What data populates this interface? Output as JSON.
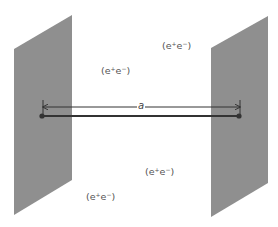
{
  "diagram": {
    "plates": [
      {
        "id": "left",
        "points": "14,49 72,15 72,180 14,215"
      },
      {
        "id": "right",
        "points": "211,48 268,16 268,183 211,217"
      }
    ],
    "colors": {
      "plate": "#8f8f8f",
      "line": "#333333",
      "text": "#555555"
    },
    "separation": {
      "label": "a",
      "arrow_y": 107,
      "x_start": 43,
      "x_end": 240
    },
    "connector": {
      "y": 116,
      "x_start": 42,
      "x_end": 239
    },
    "pair_labels": [
      {
        "text_open": "(e",
        "sup1": "+",
        "mid": "e",
        "sup2": "−",
        "text_close": ")",
        "x": 101,
        "y": 66
      },
      {
        "text_open": "(e",
        "sup1": "+",
        "mid": "e",
        "sup2": "−",
        "text_close": ")",
        "x": 162,
        "y": 41
      },
      {
        "text_open": "(e",
        "sup1": "+",
        "mid": "e",
        "sup2": "−",
        "text_close": ")",
        "x": 145,
        "y": 167
      },
      {
        "text_open": "(e",
        "sup1": "+",
        "mid": "e",
        "sup2": "−",
        "text_close": ")",
        "x": 86,
        "y": 192
      }
    ]
  }
}
